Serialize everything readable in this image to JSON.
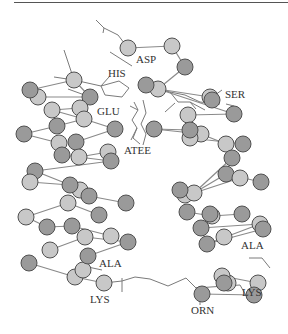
{
  "figure": {
    "type": "molecular-structure-diagram",
    "colors": {
      "atom_dark": "#9a9a9a",
      "atom_light": "#c8c8c8",
      "atom_stroke": "#505050",
      "bond": "#8a8a8a",
      "sidechain": "#7a7a7a",
      "label": "#333333",
      "rule": "#555555"
    }
  },
  "labels": {
    "asp": "ASP",
    "his": "HIS",
    "ser": "SER",
    "glu": "GLU",
    "atee": "ATEE",
    "ala_left": "ALA",
    "ala_right": "ALA",
    "lys_left": "LYS",
    "lys_right": "LYS",
    "orn": "ORN"
  },
  "atoms": [
    {
      "x": 128,
      "y": 48,
      "t": "l"
    },
    {
      "x": 172,
      "y": 46,
      "t": "l"
    },
    {
      "x": 185,
      "y": 67,
      "t": "d"
    },
    {
      "x": 74,
      "y": 80,
      "t": "l"
    },
    {
      "x": 30,
      "y": 90,
      "t": "d"
    },
    {
      "x": 38,
      "y": 97,
      "t": "l"
    },
    {
      "x": 90,
      "y": 97,
      "t": "d"
    },
    {
      "x": 146,
      "y": 85,
      "t": "d"
    },
    {
      "x": 158,
      "y": 89,
      "t": "l"
    },
    {
      "x": 210,
      "y": 97,
      "t": "d"
    },
    {
      "x": 212,
      "y": 100,
      "t": "d"
    },
    {
      "x": 52,
      "y": 110,
      "t": "l"
    },
    {
      "x": 80,
      "y": 108,
      "t": "l"
    },
    {
      "x": 84,
      "y": 119,
      "t": "l"
    },
    {
      "x": 57,
      "y": 126,
      "t": "d"
    },
    {
      "x": 24,
      "y": 134,
      "t": "d"
    },
    {
      "x": 115,
      "y": 129,
      "t": "d"
    },
    {
      "x": 59,
      "y": 143,
      "t": "l"
    },
    {
      "x": 76,
      "y": 142,
      "t": "d"
    },
    {
      "x": 62,
      "y": 155,
      "t": "d"
    },
    {
      "x": 79,
      "y": 157,
      "t": "l"
    },
    {
      "x": 108,
      "y": 152,
      "t": "l"
    },
    {
      "x": 111,
      "y": 161,
      "t": "d"
    },
    {
      "x": 188,
      "y": 115,
      "t": "l"
    },
    {
      "x": 234,
      "y": 114,
      "t": "d"
    },
    {
      "x": 154,
      "y": 129,
      "t": "d"
    },
    {
      "x": 190,
      "y": 130,
      "t": "d"
    },
    {
      "x": 201,
      "y": 134,
      "t": "l"
    },
    {
      "x": 190,
      "y": 138,
      "t": "l"
    },
    {
      "x": 226,
      "y": 144,
      "t": "l"
    },
    {
      "x": 243,
      "y": 144,
      "t": "d"
    },
    {
      "x": 232,
      "y": 158,
      "t": "d"
    },
    {
      "x": 35,
      "y": 171,
      "t": "d"
    },
    {
      "x": 30,
      "y": 182,
      "t": "l"
    },
    {
      "x": 185,
      "y": 195,
      "t": "l"
    },
    {
      "x": 180,
      "y": 190,
      "t": "d"
    },
    {
      "x": 194,
      "y": 193,
      "t": "l"
    },
    {
      "x": 226,
      "y": 174,
      "t": "d"
    },
    {
      "x": 240,
      "y": 178,
      "t": "l"
    },
    {
      "x": 261,
      "y": 182,
      "t": "d"
    },
    {
      "x": 70,
      "y": 185,
      "t": "d"
    },
    {
      "x": 80,
      "y": 190,
      "t": "l"
    },
    {
      "x": 89,
      "y": 196,
      "t": "d"
    },
    {
      "x": 68,
      "y": 203,
      "t": "l"
    },
    {
      "x": 126,
      "y": 203,
      "t": "d"
    },
    {
      "x": 99,
      "y": 215,
      "t": "l"
    },
    {
      "x": 26,
      "y": 217,
      "t": "l"
    },
    {
      "x": 187,
      "y": 212,
      "t": "d"
    },
    {
      "x": 212,
      "y": 216,
      "t": "l"
    },
    {
      "x": 210,
      "y": 214,
      "t": "d"
    },
    {
      "x": 242,
      "y": 214,
      "t": "d"
    },
    {
      "x": 47,
      "y": 227,
      "t": "d"
    },
    {
      "x": 72,
      "y": 226,
      "t": "d"
    },
    {
      "x": 85,
      "y": 237,
      "t": "l"
    },
    {
      "x": 111,
      "y": 236,
      "t": "l"
    },
    {
      "x": 128,
      "y": 242,
      "t": "d"
    },
    {
      "x": 50,
      "y": 250,
      "t": "l"
    },
    {
      "x": 201,
      "y": 228,
      "t": "d"
    },
    {
      "x": 207,
      "y": 244,
      "t": "d"
    },
    {
      "x": 224,
      "y": 237,
      "t": "d"
    },
    {
      "x": 260,
      "y": 224,
      "t": "l"
    },
    {
      "x": 263,
      "y": 229,
      "t": "d"
    },
    {
      "x": 88,
      "y": 256,
      "t": "d"
    },
    {
      "x": 29,
      "y": 263,
      "t": "d"
    },
    {
      "x": 83,
      "y": 270,
      "t": "l"
    },
    {
      "x": 75,
      "y": 277,
      "t": "l"
    },
    {
      "x": 104,
      "y": 283,
      "t": "l"
    },
    {
      "x": 222,
      "y": 276,
      "t": "d"
    },
    {
      "x": 228,
      "y": 283,
      "t": "l"
    },
    {
      "x": 224,
      "y": 283,
      "t": "d"
    },
    {
      "x": 202,
      "y": 294,
      "t": "d"
    },
    {
      "x": 258,
      "y": 283,
      "t": "l"
    },
    {
      "x": 254,
      "y": 295,
      "t": "d"
    }
  ]
}
